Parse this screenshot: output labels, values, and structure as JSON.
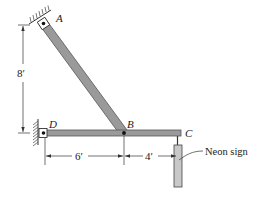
{
  "diagram": {
    "points": {
      "A": "A",
      "B": "B",
      "C": "C",
      "D": "D"
    },
    "dimensions": {
      "vertical": "8′",
      "horizontal_DB": "6′",
      "horizontal_BC": "4′"
    },
    "callout": "Neon sign",
    "colors": {
      "member": "#9a9a9a",
      "member_outline": "#555555",
      "sign": "#c8c8c8",
      "line": "#333333"
    }
  }
}
